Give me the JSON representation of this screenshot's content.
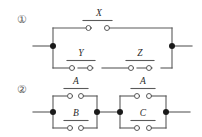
{
  "figure": {
    "background_color": "#ffffff",
    "wire_color": "#5a5a5a",
    "node_color": "#1a1a1a",
    "label_color": "#2b2b2b",
    "index_color": "#555555"
  },
  "circuits": [
    {
      "index_label": "①",
      "index_name": "circled-one",
      "description": "Switch X in parallel with series pair Y and Z",
      "switch_labels": [
        "X",
        "Y",
        "Z"
      ],
      "branches": [
        {
          "name": "top-branch",
          "switches": [
            "X"
          ]
        },
        {
          "name": "bottom-branch",
          "switches": [
            "Y",
            "Z"
          ]
        }
      ]
    },
    {
      "index_label": "②",
      "index_name": "circled-two",
      "description": "Parallel block A and B in series with parallel block A and C",
      "switch_labels": [
        "A",
        "B",
        "A",
        "C"
      ],
      "blocks": [
        {
          "name": "left-block",
          "top_switch": "A",
          "bottom_switch": "B"
        },
        {
          "name": "right-block",
          "top_switch": "A",
          "bottom_switch": "C"
        }
      ]
    }
  ],
  "labels": {
    "c1_top": "X",
    "c1_bottom_left": "Y",
    "c1_bottom_right": "Z",
    "c2_left_top": "A",
    "c2_left_bottom": "B",
    "c2_right_top": "A",
    "c2_right_bottom": "C",
    "index_one": "①",
    "index_two": "②"
  }
}
